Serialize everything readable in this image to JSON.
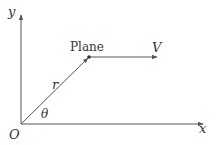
{
  "diagram": {
    "type": "kinematics-polar-coordinates",
    "colors": {
      "line": "#555555",
      "text": "#333333",
      "background": "#ffffff"
    },
    "axes": {
      "x_label": "x",
      "y_label": "y",
      "origin_label": "O"
    },
    "object": {
      "label": "Plane"
    },
    "vectors": {
      "position": {
        "label": "r"
      },
      "velocity": {
        "label": "V"
      }
    },
    "angle": {
      "label": "θ"
    }
  }
}
